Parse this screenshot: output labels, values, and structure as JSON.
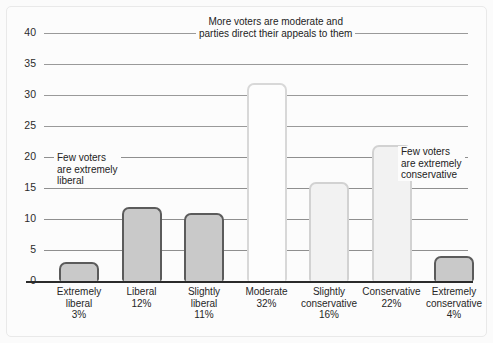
{
  "chart_data": {
    "type": "bar",
    "title": "",
    "xlabel": "",
    "ylabel": "",
    "ylim": [
      0,
      40
    ],
    "grid": true,
    "legend": "none",
    "yticks": [
      "40",
      "35",
      "30",
      "25",
      "20",
      "15",
      "10",
      "5",
      "0"
    ],
    "ytick_values": [
      40,
      35,
      30,
      25,
      20,
      15,
      10,
      5,
      0
    ],
    "categories": [
      "Extremely liberal",
      "Liberal",
      "Slightly liberal",
      "Moderate",
      "Slightly conservative",
      "Conservative",
      "Extremely conservative"
    ],
    "values": [
      3,
      12,
      11,
      32,
      16,
      22,
      4
    ],
    "data_labels": [
      "3%",
      "12%",
      "11%",
      "32%",
      "16%",
      "22%",
      "4%"
    ],
    "bars": [
      {
        "line1": "Extremely",
        "line2": "liberal",
        "pct": "3%",
        "value": 3,
        "style": "dark"
      },
      {
        "line1": "Liberal",
        "line2": "",
        "pct": "12%",
        "value": 12,
        "style": "dark"
      },
      {
        "line1": "Slightly",
        "line2": "liberal",
        "pct": "11%",
        "value": 11,
        "style": "dark"
      },
      {
        "line1": "Moderate",
        "line2": "",
        "pct": "32%",
        "value": 32,
        "style": "light"
      },
      {
        "line1": "Slightly",
        "line2": "conservative",
        "pct": "16%",
        "value": 16,
        "style": "mid"
      },
      {
        "line1": "Conservative",
        "line2": "",
        "pct": "22%",
        "value": 22,
        "style": "mid"
      },
      {
        "line1": "Extremely",
        "line2": "conservative",
        "pct": "4%",
        "value": 4,
        "style": "dark"
      }
    ],
    "annotations": [
      {
        "id": "top",
        "line1": "More voters are moderate and",
        "line2": "parties direct their appeals to them",
        "line3": ""
      },
      {
        "id": "left",
        "line1": "Few voters",
        "line2": "are extremely",
        "line3": "liberal"
      },
      {
        "id": "right",
        "line1": "Few voters",
        "line2": "are extremely",
        "line3": "conservative"
      }
    ],
    "colors": {
      "bar_dark_fill": "#c9c9c9",
      "bar_dark_stroke": "#5b5b5b",
      "bar_light_fill": "#fdfdfd",
      "bar_light_stroke": "#d8d8d8",
      "bar_mid_fill": "#f2f2f2",
      "bar_mid_stroke": "#d2d2d2",
      "gridline": "#8f8f8f",
      "axis": "#2b2b2b",
      "background": "#fcfcfc",
      "text": "#232323"
    }
  }
}
